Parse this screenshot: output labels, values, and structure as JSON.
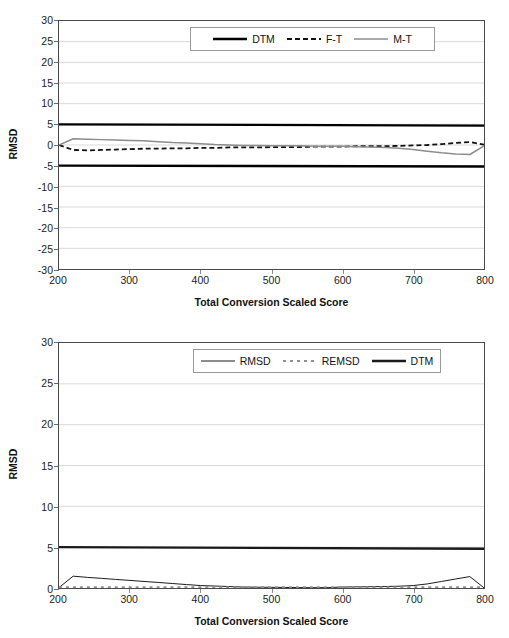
{
  "figure": {
    "panels": [
      "chart-top",
      "chart-bottom"
    ]
  },
  "chart_data": [
    {
      "id": "chart-top",
      "type": "line",
      "title": "",
      "xlabel": "Total Conversion Scaled Score",
      "ylabel": "RMSD",
      "xlim": [
        200,
        800
      ],
      "ylim": [
        -30,
        30
      ],
      "xticks": [
        200,
        300,
        400,
        500,
        600,
        700,
        800
      ],
      "yticks": [
        30,
        25,
        20,
        15,
        10,
        5,
        0,
        -5,
        -10,
        -15,
        -20,
        -25,
        -30
      ],
      "grid": "horizontal",
      "legend_position": "top-center",
      "series": [
        {
          "name": "DTM",
          "style": "solid-thick-black",
          "color": "#000000",
          "x": [
            200,
            800
          ],
          "values": [
            5,
            4.7
          ]
        },
        {
          "name": "DTM-lower",
          "style": "solid-thick-black",
          "color": "#000000",
          "hidden_from_legend": true,
          "x": [
            200,
            800
          ],
          "values": [
            -5,
            -5.2
          ]
        },
        {
          "name": "F-T",
          "style": "dashed-black",
          "color": "#111111",
          "x": [
            200,
            220,
            240,
            260,
            280,
            300,
            320,
            340,
            360,
            380,
            400,
            420,
            440,
            460,
            480,
            500,
            520,
            540,
            560,
            580,
            600,
            620,
            640,
            660,
            680,
            700,
            720,
            740,
            760,
            780,
            800
          ],
          "values": [
            0.0,
            -1.2,
            -1.3,
            -1.2,
            -1.1,
            -1.0,
            -0.9,
            -0.9,
            -0.8,
            -0.8,
            -0.7,
            -0.7,
            -0.6,
            -0.6,
            -0.6,
            -0.5,
            -0.5,
            -0.5,
            -0.4,
            -0.4,
            -0.4,
            -0.3,
            -0.3,
            -0.3,
            -0.2,
            -0.1,
            0.0,
            0.2,
            0.5,
            0.7,
            0.1
          ]
        },
        {
          "name": "M-T",
          "style": "solid-gray",
          "color": "#8c8c8c",
          "x": [
            200,
            220,
            240,
            260,
            280,
            300,
            320,
            340,
            360,
            380,
            400,
            420,
            440,
            460,
            480,
            500,
            520,
            540,
            560,
            580,
            600,
            620,
            640,
            660,
            680,
            700,
            720,
            740,
            760,
            780,
            800
          ],
          "values": [
            0.0,
            1.5,
            1.4,
            1.3,
            1.2,
            1.1,
            1.0,
            0.8,
            0.6,
            0.5,
            0.3,
            0.1,
            0.0,
            -0.1,
            -0.1,
            -0.2,
            -0.2,
            -0.2,
            -0.3,
            -0.3,
            -0.3,
            -0.4,
            -0.5,
            -0.6,
            -0.8,
            -1.1,
            -1.5,
            -1.9,
            -2.2,
            -2.3,
            -0.2
          ]
        }
      ]
    },
    {
      "id": "chart-bottom",
      "type": "line",
      "title": "",
      "xlabel": "Total Conversion Scaled Score",
      "ylabel": "RMSD",
      "xlim": [
        200,
        800
      ],
      "ylim": [
        0,
        30
      ],
      "xticks": [
        200,
        300,
        400,
        500,
        600,
        700,
        800
      ],
      "yticks": [
        30,
        25,
        20,
        15,
        10,
        5,
        0
      ],
      "grid": "horizontal",
      "legend_position": "top-center",
      "series": [
        {
          "name": "RMSD",
          "style": "solid-thin-black",
          "color": "#1a1a1a",
          "x": [
            200,
            220,
            240,
            260,
            280,
            300,
            320,
            340,
            360,
            380,
            400,
            420,
            440,
            460,
            480,
            500,
            520,
            540,
            560,
            580,
            600,
            620,
            640,
            660,
            680,
            700,
            720,
            740,
            760,
            780,
            800
          ],
          "values": [
            0.05,
            1.45,
            1.3,
            1.18,
            1.05,
            0.93,
            0.8,
            0.68,
            0.55,
            0.42,
            0.3,
            0.24,
            0.18,
            0.12,
            0.1,
            0.08,
            0.07,
            0.05,
            0.04,
            0.05,
            0.12,
            0.14,
            0.16,
            0.18,
            0.22,
            0.3,
            0.5,
            0.8,
            1.1,
            1.4,
            0.02
          ]
        },
        {
          "name": "REMSD",
          "style": "dotted-gray",
          "color": "#8f8f8f",
          "x": [
            200,
            800
          ],
          "values": [
            0.1,
            0.1
          ]
        },
        {
          "name": "DTM",
          "style": "solid-thick-black",
          "color": "#1a1a1a",
          "x": [
            200,
            800
          ],
          "values": [
            5,
            4.8
          ]
        }
      ]
    }
  ]
}
